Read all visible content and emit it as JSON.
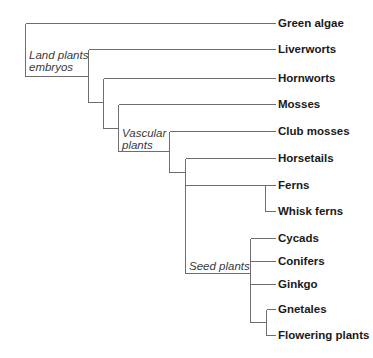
{
  "diagram": {
    "type": "phylogenetic-tree",
    "line_color": "#6e6e6e",
    "text_color": "#1a1a1a",
    "taxa": [
      {
        "label": "Green algae",
        "y": 23
      },
      {
        "label": "Liverworts",
        "y": 49
      },
      {
        "label": "Hornworts",
        "y": 78
      },
      {
        "label": "Mosses",
        "y": 104
      },
      {
        "label": "Club mosses",
        "y": 131
      },
      {
        "label": "Horsetails",
        "y": 158
      },
      {
        "label": "Ferns",
        "y": 185
      },
      {
        "label": "Whisk ferns",
        "y": 211
      },
      {
        "label": "Cycads",
        "y": 238
      },
      {
        "label": "Conifers",
        "y": 261
      },
      {
        "label": "Ginkgo",
        "y": 284
      },
      {
        "label": "Gnetales",
        "y": 309
      },
      {
        "label": "Flowering plants",
        "y": 335
      }
    ],
    "clades": {
      "land_plants": {
        "line1": "Land plants",
        "line2": "embryos"
      },
      "vascular": {
        "line1": "Vascular",
        "line2": "plants"
      },
      "seed": {
        "line1": "Seed plants"
      }
    }
  }
}
